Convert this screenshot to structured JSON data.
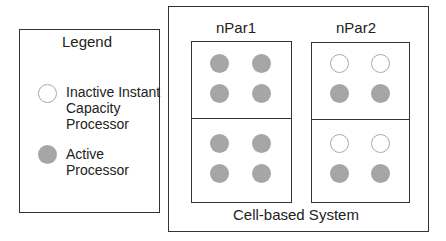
{
  "legend": {
    "title": "Legend",
    "items": [
      {
        "type": "inactive",
        "label_lines": [
          "Inactive Instant",
          "Capacity",
          "Processor"
        ]
      },
      {
        "type": "active",
        "label_lines": [
          "Active",
          "Processor"
        ]
      }
    ]
  },
  "system": {
    "label": "Cell-based System",
    "partitions": [
      {
        "name": "nPar1",
        "cells": [
          {
            "processors": [
              "active",
              "active",
              "active",
              "active"
            ]
          },
          {
            "processors": [
              "active",
              "active",
              "active",
              "active"
            ]
          }
        ]
      },
      {
        "name": "nPar2",
        "cells": [
          {
            "processors": [
              "inactive",
              "inactive",
              "active",
              "active"
            ]
          },
          {
            "processors": [
              "inactive",
              "inactive",
              "active",
              "active"
            ]
          }
        ]
      }
    ]
  },
  "colors": {
    "active": "#a6a6a6",
    "inactive_border": "#aaaaaa",
    "line": "#333333"
  }
}
